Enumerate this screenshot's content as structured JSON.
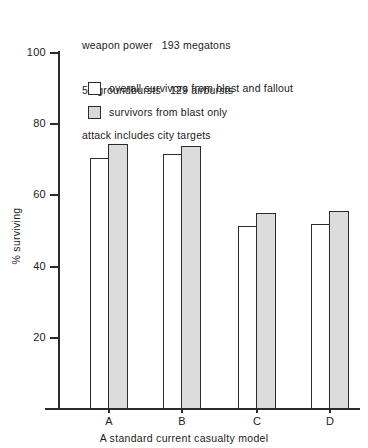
{
  "chart_data": {
    "type": "bar",
    "title": "",
    "caption": "A standard current casualty model",
    "xlabel": "",
    "ylabel": "% surviving",
    "ylim": [
      0,
      100
    ],
    "yticks": [
      20,
      40,
      60,
      80,
      100
    ],
    "ytick_labels": [
      "20",
      "40",
      "60",
      "80",
      "100"
    ],
    "grid": false,
    "legend_position": "upper-left-inside",
    "categories": [
      "A",
      "B",
      "C",
      "D"
    ],
    "series": [
      {
        "name": "overall survivors from blast and fallout",
        "swatch": "white",
        "values": [
          70.5,
          71.5,
          51.5,
          52.0
        ]
      },
      {
        "name": "survivors from blast only",
        "swatch": "gray",
        "values": [
          74.5,
          74.0,
          55.0,
          55.5
        ]
      }
    ],
    "annotations": [
      "weapon power   193 megatons",
      "50 groundbursts   129 airbursts",
      "attack includes city targets"
    ]
  },
  "annotation_lines": {
    "line1_a": "weapon power",
    "line1_b": "193 megatons",
    "line2_a": "50 groundbursts",
    "line2_b": "129 airbursts",
    "line3": "attack includes city targets"
  },
  "legend": {
    "items": [
      {
        "label": "overall survivors from blast and fallout",
        "swatch": "white"
      },
      {
        "label": "survivors from blast only",
        "swatch": "gray"
      }
    ]
  },
  "axes": {
    "ylabel": "% surviving",
    "ytick_labels": [
      "100",
      "80",
      "60",
      "40",
      "20"
    ],
    "xtick_labels": [
      "A",
      "B",
      "C",
      "D"
    ]
  },
  "caption": "A standard current casualty model",
  "colors": {
    "ink": "#2b2b2b",
    "bar_gray": "#dcdcdc",
    "bar_white": "#ffffff",
    "background": "#ffffff"
  }
}
